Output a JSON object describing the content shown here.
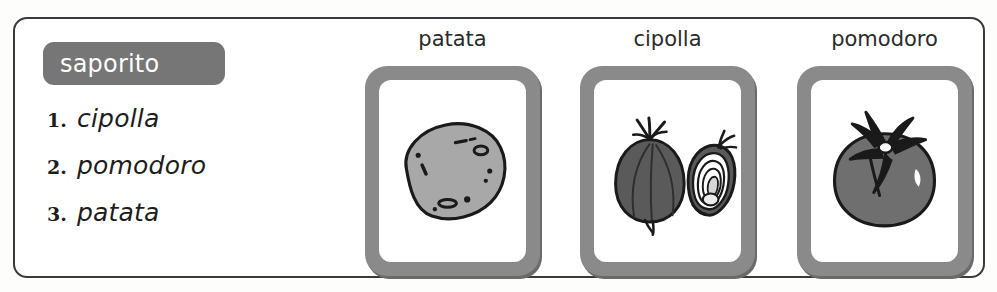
{
  "panel": {
    "category_badge": "saporito",
    "answers": [
      {
        "number": "1.",
        "word": "cipolla"
      },
      {
        "number": "2.",
        "word": "pomodoro"
      },
      {
        "number": "3.",
        "word": "patata"
      }
    ]
  },
  "pictures": [
    {
      "label": "patata",
      "icon": "potato-illustration"
    },
    {
      "label": "cipolla",
      "icon": "onion-illustration"
    },
    {
      "label": "pomodoro",
      "icon": "tomato-illustration"
    }
  ],
  "colors": {
    "badge_background": "#767676",
    "badge_text": "#ffffff",
    "card_frame": "#8a8a8a",
    "card_inner": "#ffffff",
    "frame_border": "#3a3a3a",
    "potato_fill": "#a8a8a8",
    "onion_fill": "#5a5a5a",
    "tomato_fill": "#6f6f6f",
    "outline": "#1a1a1a"
  }
}
